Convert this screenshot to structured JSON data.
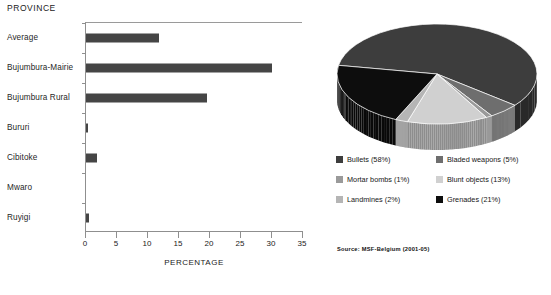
{
  "bar_panel": {
    "title": "PROVINCE",
    "xaxis_title": "PERCENTAGE"
  },
  "pie_panel": {
    "source": "Source: MSF-Belgium (2001-05)"
  },
  "colors": {
    "bar_fill": "#454545",
    "axis": "#8f8f8f",
    "bullets": "#3d3d3d",
    "bladed_weapons": "#6e6e6e",
    "mortar_bombs": "#9a9a9a",
    "blunt_objects": "#d0d0d0",
    "landmines": "#b5b5b5",
    "grenades": "#0d0d0d"
  },
  "chart_data": [
    {
      "type": "bar",
      "title": "PROVINCE",
      "xlabel": "PERCENTAGE",
      "ylabel": "PROVINCE",
      "orientation": "horizontal",
      "categories": [
        "Average",
        "Bujumbura-Mairie",
        "Bujumbura Rural",
        "Bururi",
        "Cibitoke",
        "Mwaro",
        "Ruyigi"
      ],
      "values": [
        11.8,
        30.0,
        19.5,
        0.3,
        1.7,
        0.0,
        0.5
      ],
      "xlim": [
        0,
        35
      ],
      "xticks": [
        0,
        5,
        10,
        15,
        20,
        25,
        30,
        35
      ],
      "xtick_labels": [
        "0",
        "5",
        "10",
        "15",
        "20",
        "25",
        "30",
        "35"
      ],
      "grid": false,
      "legend": false
    },
    {
      "type": "pie",
      "title": "",
      "three_d": true,
      "labels": [
        "Bullets",
        "Bladed weapons",
        "Mortar bombs",
        "Blunt objects",
        "Landmines",
        "Grenades"
      ],
      "values": [
        58,
        5,
        1,
        13,
        2,
        21
      ],
      "legend_entries": [
        "Bullets (58%)",
        "Bladed weapons (5%)",
        "Mortar bombs (1%)",
        "Blunt objects (13%)",
        "Landmines (2%)",
        "Grenades (21%)"
      ],
      "legend_order": [
        "Bullets (58%)",
        "Bladed weapons (5%)",
        "Mortar bombs (1%)",
        "Blunt objects (13%)",
        "Landmines (2%)",
        "Grenades (21%)"
      ],
      "legend_position": "bottom",
      "source": "Source: MSF-Belgium (2001-05)"
    }
  ]
}
